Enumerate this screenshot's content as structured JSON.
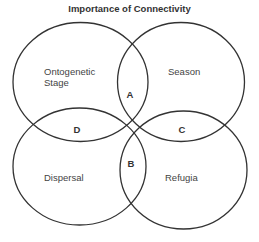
{
  "title": "Importance of Connectivity",
  "colors": {
    "stroke": "#333333",
    "text": "#444444",
    "background": "#ffffff"
  },
  "sets": [
    {
      "id": "ontogenetic-stage",
      "label_line1": "Ontogenetic",
      "label_line2": "Stage",
      "position": "top-left"
    },
    {
      "id": "season",
      "label": "Season",
      "position": "top-right"
    },
    {
      "id": "dispersal",
      "label": "Dispersal",
      "position": "bottom-left"
    },
    {
      "id": "refugia",
      "label": "Refugia",
      "position": "bottom-right"
    }
  ],
  "intersections": [
    {
      "label": "A",
      "between": [
        "Ontogenetic Stage",
        "Season"
      ]
    },
    {
      "label": "B",
      "between": [
        "Dispersal",
        "Refugia"
      ]
    },
    {
      "label": "C",
      "between": [
        "Season",
        "Refugia"
      ]
    },
    {
      "label": "D",
      "between": [
        "Ontogenetic Stage",
        "Dispersal"
      ]
    }
  ]
}
